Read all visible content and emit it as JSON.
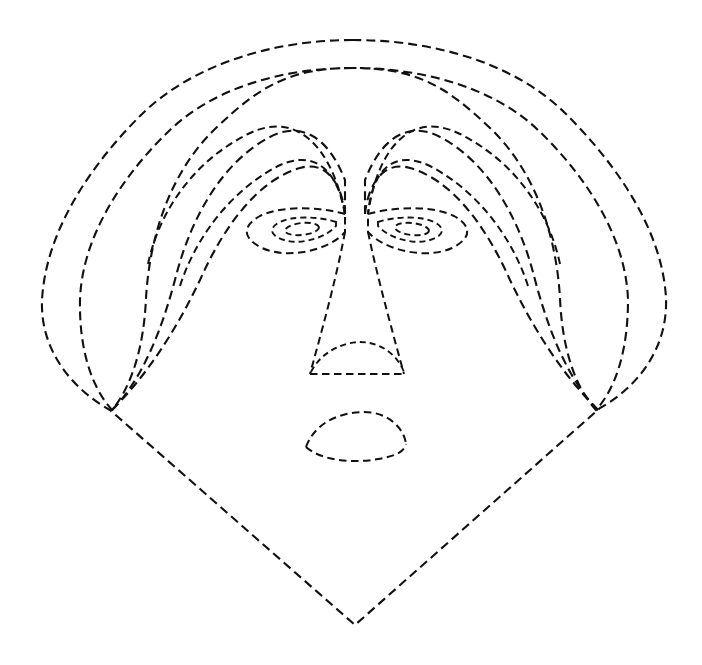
{
  "artwork": {
    "title": "Dashed Line-Art Face",
    "description": "Minimalist contour drawing of a human face rendered entirely with dashed black outlines on a white background",
    "background_color": "#ffffff",
    "stroke_color": "#111111",
    "stroke_width": 2.1,
    "dash_pattern": "9 5",
    "canvas": {
      "width": 702,
      "height": 665
    }
  },
  "shapes": {
    "silhouette_outer": {
      "name": "outer-head-contour",
      "path": "M 353 40 C 270 40 190 66 140 116 C 94 162 46 228 42 300 C 40 352 74 390 110 410 L 355 625 L 600 408 C 636 388 668 350 666 298 C 662 226 612 160 566 114 C 516 64 436 40 353 40 Z"
    },
    "silhouette_inner_1": {
      "name": "second-head-contour",
      "path": "M 353 68 C 282 68 214 88 170 130 C 126 172 82 234 80 300 C 79 350 92 388 112 410 C 132 386 144 346 146 298 C 150 232 172 170 216 128 C 260 86 290 68 353 68 C 416 68 446 86 490 128 C 534 170 556 232 560 298 C 562 346 574 386 596 410 C 616 388 628 350 628 300 C 626 234 582 172 538 130 C 494 88 424 68 353 68 Z"
    },
    "silhouette_inner_2": {
      "name": "third-head-contour",
      "path": "M 112 410 C 142 380 162 330 176 276 C 192 214 224 162 268 138 C 300 120 328 136 345 180 L 345 214"
    },
    "silhouette_inner_3": {
      "name": "fourth-head-contour",
      "path": "M 112 410 C 150 372 178 326 200 280 C 224 226 258 180 300 168 C 326 160 342 184 345 214"
    },
    "brow_left_outer": {
      "name": "left-eyebrow-outer-arc",
      "path": "M 148 264 C 160 208 196 160 248 134 C 296 110 332 146 345 214"
    },
    "brow_left_inner": {
      "name": "left-eyebrow-inner-arc",
      "path": "M 180 286 C 196 236 232 190 278 166 C 316 148 338 172 345 214"
    },
    "brow_right_outer": {
      "name": "right-eyebrow-outer-arc",
      "path": "M 560 264 C 548 208 512 160 460 134 C 412 110 378 146 368 214"
    },
    "brow_right_inner": {
      "name": "right-eyebrow-inner-arc",
      "path": "M 528 286 C 512 236 476 190 430 166 C 392 148 372 172 368 214"
    },
    "eye_left_outer": {
      "name": "left-eye-outline",
      "path": "M 345 214 C 316 206 280 206 260 216 C 242 226 242 238 262 248 C 288 260 330 250 345 232 Z"
    },
    "eye_left_iris": {
      "name": "left-eye-iris",
      "path": "M 336 222 C 318 216 292 216 280 222 C 268 228 270 236 284 240 C 302 246 328 236 336 226 Z"
    },
    "eye_left_pupil": {
      "name": "left-eye-pupil",
      "cx": 302,
      "cy": 229,
      "rx": 17,
      "ry": 6,
      "rotate": -6
    },
    "eye_right_outer": {
      "name": "right-eye-outline",
      "path": "M 368 214 C 398 206 434 206 454 216 C 472 226 472 238 452 248 C 426 260 384 250 368 232 Z"
    },
    "eye_right_iris": {
      "name": "right-eye-iris",
      "path": "M 378 222 C 396 216 422 216 434 222 C 446 228 444 236 430 240 C 412 246 386 236 378 226 Z"
    },
    "eye_right_pupil": {
      "name": "right-eye-pupil",
      "cx": 412,
      "cy": 229,
      "rx": 17,
      "ry": 6,
      "rotate": 6
    },
    "nose_bridge_left": {
      "name": "nose-left-edge",
      "path": "M 345 232 C 336 280 322 330 310 374"
    },
    "nose_bridge_right": {
      "name": "nose-right-edge",
      "path": "M 368 232 C 378 280 392 330 404 374"
    },
    "nose_base": {
      "name": "nose-base-line",
      "path": "M 310 374 L 404 374"
    },
    "nose_tip_arc": {
      "name": "nose-tip-arc",
      "path": "M 311 372 C 322 350 346 342 360 342 C 378 342 396 352 404 372"
    },
    "mouth_upper": {
      "name": "mouth-upper-lip",
      "path": "M 306 447 C 316 420 344 412 364 412 C 388 412 404 428 406 444"
    },
    "mouth_lower": {
      "name": "mouth-lower-lip",
      "path": "M 306 447 C 320 460 352 464 378 459 C 396 456 404 452 406 444"
    },
    "chin_left": {
      "name": "left-jawline",
      "path": "M 110 410 L 355 625"
    },
    "chin_right": {
      "name": "right-jawline",
      "path": "M 600 408 L 355 625"
    }
  },
  "anchors": {
    "left_convergence": {
      "x": 110,
      "y": 410,
      "label": "left-temple-convergence-point"
    },
    "right_convergence": {
      "x": 600,
      "y": 408,
      "label": "right-temple-convergence-point"
    },
    "chin_point": {
      "x": 355,
      "y": 625,
      "label": "chin-apex"
    },
    "left_eye_corner": {
      "x": 345,
      "y": 214,
      "label": "left-inner-eye-corner"
    },
    "right_eye_corner": {
      "x": 368,
      "y": 214,
      "label": "right-inner-eye-corner"
    }
  }
}
